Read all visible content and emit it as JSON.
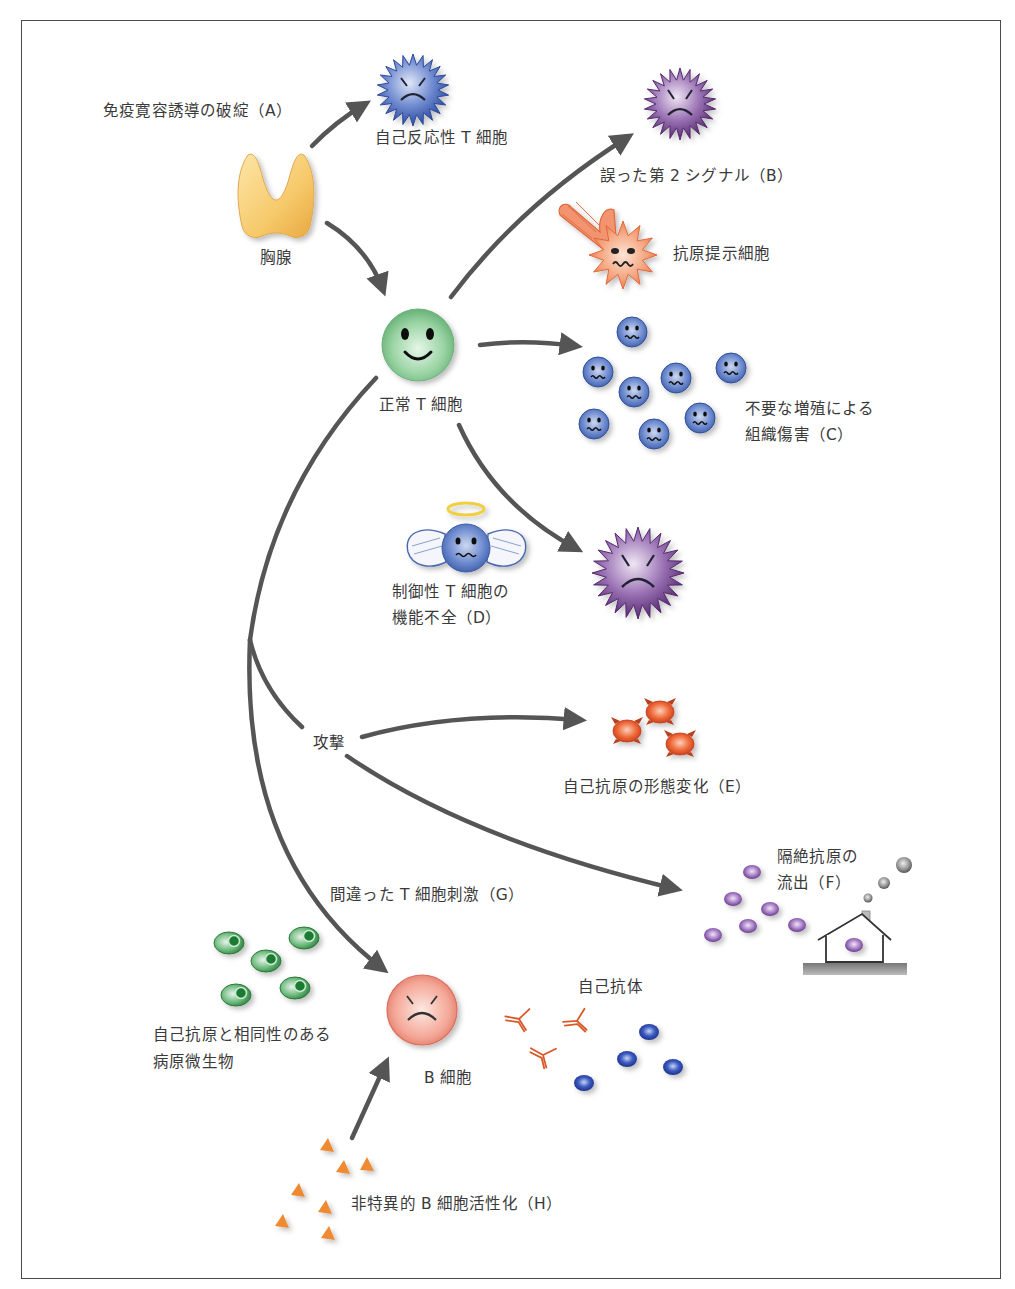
{
  "figure": {
    "colors": {
      "arrow": "#555555",
      "frame": "#4a4a4a",
      "text": "#3a3a3a",
      "thymus": "#f6c96a",
      "normal_t_cell": "#8fcf9a",
      "autoreactive_t_cell": "#3c5aa8",
      "activated_t_cell": "#6a3a80",
      "apc": "#f08c64",
      "proliferating_cell": "#4a6fb8",
      "regulatory_t_cell": "#5a7cc0",
      "altered_self_antigen": "#e85a30",
      "sequestered_antigen": "#9a6ab8",
      "microbe": "#3a9a4a",
      "b_cell": "#f0a090",
      "antibody": "#d85a2a",
      "autoantibody_dot": "#2a4aa8",
      "polyclonal_activator": "#f08a30"
    },
    "nodes": {
      "thymus": {
        "label": "胸腺",
        "icon": "thymus-icon"
      },
      "autoreactive_t_cell": {
        "label": "自己反応性 T 細胞",
        "icon": "spiky-angry-blue-cell-icon"
      },
      "normal_t_cell": {
        "label": "正常 T 細胞",
        "icon": "smiling-green-cell-icon"
      },
      "b_cell": {
        "label": "B 細胞",
        "icon": "angry-pink-cell-icon"
      },
      "apc": {
        "label": "抗原提示細胞",
        "icon": "antigen-presenting-cell-icon"
      },
      "autoantibody": {
        "label": "自己抗体",
        "icon": "antibody-icon"
      }
    },
    "mechanisms": {
      "A": {
        "label": "免疫寛容誘導の破綻（A）"
      },
      "B": {
        "label": "誤った第 2 シグナル（B）"
      },
      "C": {
        "line1": "不要な増殖による",
        "line2": "組織傷害（C）"
      },
      "D": {
        "line1": "制御性 T 細胞の",
        "line2": "機能不全（D）"
      },
      "attack": {
        "label": "攻撃"
      },
      "E": {
        "label": "自己抗原の形態変化（E）"
      },
      "F": {
        "line1": "隔絶抗原の",
        "line2": "流出（F）"
      },
      "G": {
        "label": "間違った T 細胞刺激（G）"
      },
      "microbe": {
        "line1": "自己抗原と相同性のある",
        "line2": "病原微生物"
      },
      "H": {
        "label": "非特異的 B 細胞活性化（H）"
      }
    }
  }
}
